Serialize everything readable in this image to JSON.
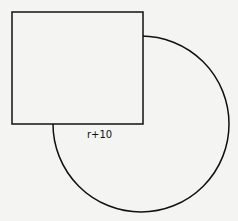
{
  "diagram": {
    "label": "r+10",
    "shapes": [
      {
        "type": "square",
        "x": 12,
        "y": 12,
        "width": 131,
        "height": 112
      },
      {
        "type": "circle",
        "cx": 141,
        "cy": 124,
        "r": 89
      }
    ]
  }
}
